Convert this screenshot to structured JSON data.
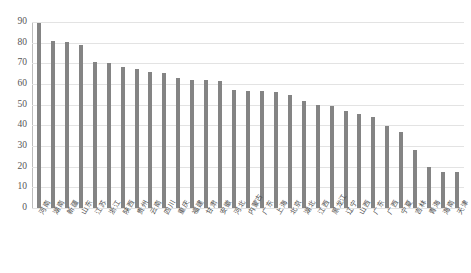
{
  "chart_data": {
    "type": "bar",
    "title": "",
    "subtitle": "",
    "xlabel": "",
    "ylabel": "",
    "ylim": [
      0,
      90
    ],
    "ytick_step": 10,
    "yticks": [
      0,
      10,
      20,
      30,
      40,
      50,
      60,
      70,
      80,
      90
    ],
    "grid": true,
    "legend": false,
    "legend_position": "none",
    "bar_color": "#848484",
    "gridline_color": "#e3e3e3",
    "axis_color": "#9a9a9a",
    "orientation": "vertical",
    "sorted": "descending",
    "categories": [
      "河南",
      "湖南",
      "新疆",
      "山东",
      "江苏",
      "浙江",
      "陕西",
      "贵州",
      "云南",
      "四川",
      "重庆",
      "福建",
      "甘肃",
      "安徽",
      "河北",
      "内蒙古",
      "广东",
      "上海",
      "北京",
      "湖北",
      "江西",
      "黑龙江",
      "辽宁",
      "山西",
      "广东",
      "广西",
      "宁夏",
      "吉林",
      "青海",
      "海南",
      "天津"
    ],
    "values": [
      89.5,
      81,
      80.5,
      79,
      70.5,
      70,
      68,
      67.5,
      66,
      65.5,
      63,
      62,
      62,
      61.5,
      57,
      56.5,
      56.5,
      56,
      54.5,
      52,
      50,
      49.5,
      47,
      45.5,
      44,
      39.5,
      37,
      28,
      20,
      17.5,
      17.5
    ]
  }
}
